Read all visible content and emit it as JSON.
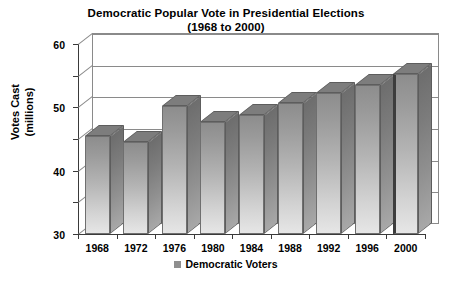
{
  "chart_data": {
    "type": "bar",
    "title": "Democratic Popular Vote in Presidential Elections",
    "subtitle": "(1968 to 2000)",
    "xlabel": "",
    "ylabel": "Votes Cast (millions)",
    "ylabel_line1": "Votes Cast",
    "ylabel_line2": "(millions)",
    "categories": [
      "1968",
      "1972",
      "1976",
      "1980",
      "1984",
      "1988",
      "1992",
      "1996",
      "2000"
    ],
    "values": [
      31,
      29,
      40.5,
      35.5,
      37.5,
      41.5,
      44.5,
      47,
      50.5
    ],
    "series": [
      {
        "name": "Democratic Voters",
        "values": [
          31,
          29,
          40.5,
          35.5,
          37.5,
          41.5,
          44.5,
          47,
          50.5
        ]
      }
    ],
    "ylim": [
      0,
      60
    ],
    "yticks": [
      "0",
      "10",
      "20",
      "30",
      "40",
      "50",
      "60"
    ],
    "ytick_values": [
      0,
      10,
      20,
      30,
      40,
      50,
      60
    ],
    "grid": true,
    "grid_axis": "y",
    "legend": {
      "position": "bottom",
      "entries": [
        {
          "label": "Democratic Voters",
          "color": "#8f8f8f"
        }
      ]
    },
    "style": {
      "three_d": true,
      "bar_fill_top": "#8d8d8d",
      "bar_fill_bottom": "#e6e6e6",
      "bar_side": "#7b7b7b",
      "axis_color": "#3a3a3a",
      "grid_color": "#8a8a8a",
      "background": "#ffffff"
    }
  }
}
